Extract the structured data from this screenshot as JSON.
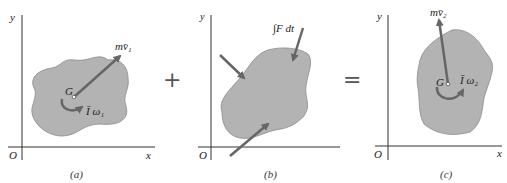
{
  "diagram": {
    "operators": {
      "plus": "+",
      "equals": "="
    },
    "colors": {
      "body_fill": "#b3b3b3",
      "body_stroke": "#8a8a8a",
      "arrow": "#666666",
      "axis": "#333333"
    },
    "panels": [
      {
        "id": "a",
        "caption": "(a)",
        "axes": {
          "x": "x",
          "y": "y",
          "origin": "O"
        },
        "point_label": "G",
        "momentum_label": "mv̄₁",
        "angular_label": "Ī ω₁"
      },
      {
        "id": "b",
        "caption": "(b)",
        "axes": {
          "x": "x",
          "y": "y",
          "origin": "O"
        },
        "impulse_label": "∫F dt"
      },
      {
        "id": "c",
        "caption": "(c)",
        "axes": {
          "x": "x",
          "y": "y",
          "origin": "O"
        },
        "point_label": "G",
        "momentum_label": "mv̄₂",
        "angular_label": "Ī ω₂"
      }
    ]
  }
}
